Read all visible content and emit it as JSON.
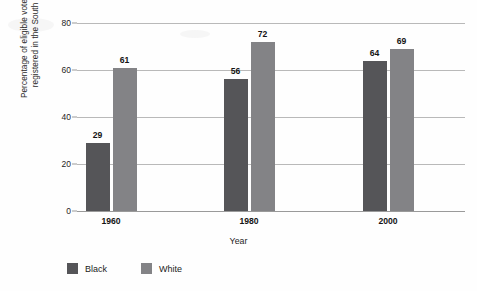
{
  "chart_data": {
    "type": "bar",
    "title": "",
    "xlabel": "Year",
    "ylabel_lines": [
      "Percentage of eligible voters",
      "registered in the South"
    ],
    "ylabel": "Percentage of eligible voters registered in the South",
    "categories": [
      "1960",
      "1980",
      "2000"
    ],
    "series": [
      {
        "name": "Black",
        "color": "#555558",
        "values": [
          29,
          56,
          64
        ]
      },
      {
        "name": "White",
        "color": "#838386",
        "values": [
          61,
          72,
          69
        ]
      }
    ],
    "ylim": [
      0,
      80
    ],
    "yticks": [
      0,
      20,
      40,
      60,
      80
    ],
    "ytick_labels": [
      "0",
      "20",
      "40",
      "60",
      "80"
    ],
    "grid": true,
    "legend_position": "bottom-left",
    "value_labels": true
  },
  "legend": {
    "items": [
      {
        "label": "Black",
        "color": "#555558"
      },
      {
        "label": "White",
        "color": "#838386"
      }
    ]
  }
}
